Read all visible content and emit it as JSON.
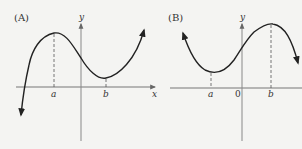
{
  "figure": {
    "panels": [
      {
        "id": "A",
        "label": "(A)",
        "x_axis_label": "x",
        "y_axis_label": "y",
        "ticks": [
          {
            "name": "a",
            "label": "a",
            "kind": "local maximum"
          },
          {
            "name": "b",
            "label": "b",
            "kind": "local minimum"
          }
        ],
        "description": "Cubic curve rising from lower-left, local maximum at x=a (left of y-axis), local minimum at x=b (right of y-axis, above x-axis), then rising to upper-right"
      },
      {
        "id": "B",
        "label": "(B)",
        "x_axis_label": "x",
        "y_axis_label": "y",
        "origin_label": "0",
        "ticks": [
          {
            "name": "a",
            "label": "a",
            "kind": "local minimum"
          },
          {
            "name": "b",
            "label": "b",
            "kind": "local maximum"
          }
        ],
        "description": "Curve descending from upper-left, local minimum at x=a (left of y-axis, above x-axis), rising to local maximum at x=b (right of y-axis), then falling to the right"
      }
    ],
    "colors": {
      "curve": "#222222",
      "axis": "#777777",
      "dashed": "#555555",
      "background": "#f4f4f2"
    }
  }
}
